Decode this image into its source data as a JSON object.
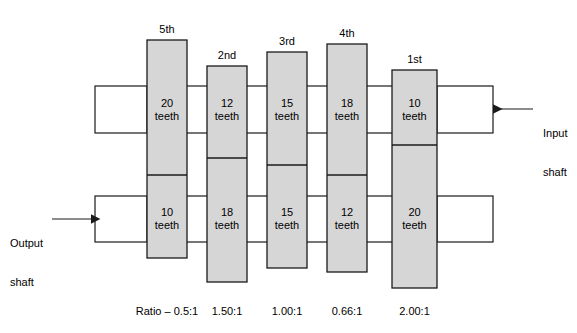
{
  "diagram": {
    "colors": {
      "gear_fill": "#d6d6d6",
      "stroke": "#1a1a1a",
      "background": "#ffffff",
      "text": "#000000"
    },
    "input_shaft": {
      "label_line1": "Input",
      "label_line2": "shaft",
      "arrow": "arrow-left-icon"
    },
    "output_shaft": {
      "label_line1": "Output",
      "label_line2": "shaft",
      "arrow": "arrow-right-icon"
    },
    "ratio_prefix": "Ratio – ",
    "gears": [
      {
        "name": "5th",
        "top_teeth": "20",
        "top_unit": "teeth",
        "bottom_teeth": "10",
        "bottom_unit": "teeth",
        "ratio": "0.5:1",
        "x": 147,
        "width": 40,
        "top": 40,
        "bottom": 258,
        "divider": 175
      },
      {
        "name": "2nd",
        "top_teeth": "12",
        "top_unit": "teeth",
        "bottom_teeth": "18",
        "bottom_unit": "teeth",
        "ratio": "1.50:1",
        "x": 207,
        "width": 40,
        "top": 66,
        "bottom": 282,
        "divider": 158
      },
      {
        "name": "3rd",
        "top_teeth": "15",
        "top_unit": "teeth",
        "bottom_teeth": "15",
        "bottom_unit": "teeth",
        "ratio": "1.00:1",
        "x": 267,
        "width": 40,
        "top": 52,
        "bottom": 268,
        "divider": 165
      },
      {
        "name": "4th",
        "top_teeth": "18",
        "top_unit": "teeth",
        "bottom_teeth": "12",
        "bottom_unit": "teeth",
        "ratio": "0.66:1",
        "x": 327,
        "width": 40,
        "top": 44,
        "bottom": 272,
        "divider": 175
      },
      {
        "name": "1st",
        "top_teeth": "10",
        "top_unit": "teeth",
        "bottom_teeth": "20",
        "bottom_unit": "teeth",
        "ratio": "2.00:1",
        "x": 392,
        "width": 45,
        "top": 70,
        "bottom": 288,
        "divider": 145
      }
    ],
    "shafts": {
      "upper": {
        "y_top": 86,
        "y_bottom": 133
      },
      "lower": {
        "y_top": 196,
        "y_bottom": 242
      }
    }
  }
}
